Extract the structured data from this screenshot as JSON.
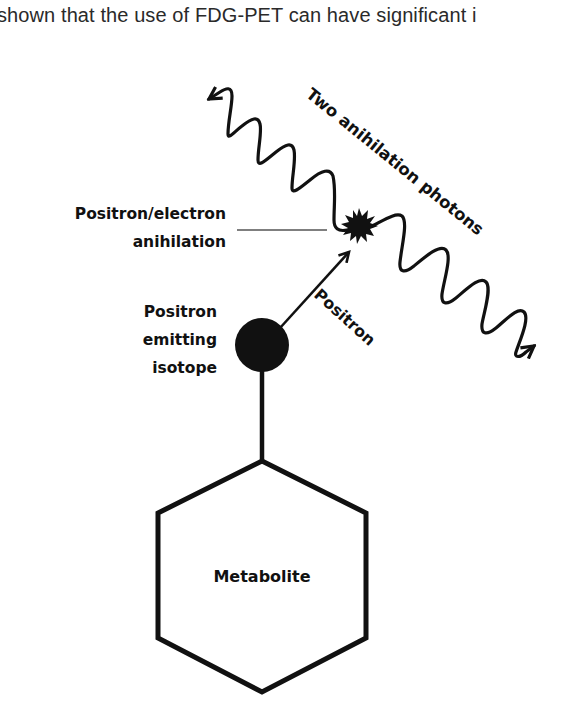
{
  "document": {
    "partial_line_above": "g  p  y  y  p",
    "top_line": "shown that the use of FDG-PET can have significant i"
  },
  "diagram": {
    "labels": {
      "annihilation_line1": "Positron/electron",
      "annihilation_line2": "anihilation",
      "isotope_line1": "Positron",
      "isotope_line2": "emitting",
      "isotope_line3": "isotope",
      "photons": "Two anihilation photons",
      "positron": "Positron",
      "metabolite": "Metabolite"
    },
    "colors": {
      "ink": "#111111",
      "background": "#ffffff",
      "leader_line": "#555555"
    }
  }
}
